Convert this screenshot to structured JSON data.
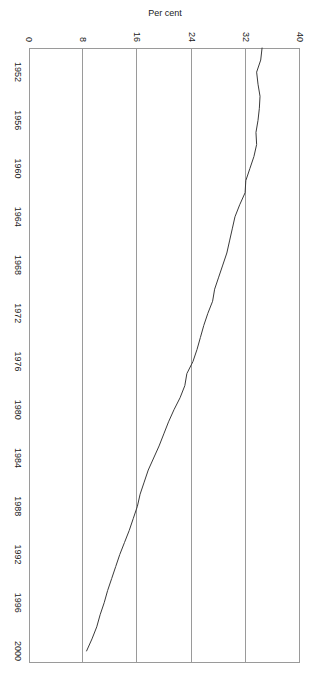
{
  "chart_data": {
    "type": "line",
    "title": "",
    "subtitle": "",
    "xlabel": "",
    "ylabel": "Per cent",
    "xlim": [
      1950,
      2001
    ],
    "ylim": [
      0,
      40
    ],
    "grid": "vertical-only-on-value-axis",
    "legend": "none",
    "orientation": "rotated-90-clockwise",
    "x_tick_labels": [
      "1952",
      "1956",
      "1960",
      "1964",
      "1968",
      "1972",
      "1976",
      "1980",
      "1984",
      "1988",
      "1992",
      "1996",
      "2000"
    ],
    "x_tick_values": [
      1952,
      1956,
      1960,
      1964,
      1968,
      1972,
      1976,
      1980,
      1984,
      1988,
      1992,
      1996,
      2000
    ],
    "y_tick_labels": [
      "0",
      "8",
      "16",
      "24",
      "32",
      "40"
    ],
    "y_tick_values": [
      0,
      8,
      16,
      24,
      32,
      40
    ],
    "line_color": "#3a3a3a",
    "axis_color": "#9a9a9a",
    "series": [
      {
        "name": "Per cent",
        "x": [
          1950,
          1951,
          1952,
          1953,
          1954,
          1955,
          1956,
          1957,
          1958,
          1959,
          1960,
          1961,
          1962,
          1963,
          1964,
          1965,
          1966,
          1967,
          1968,
          1969,
          1970,
          1971,
          1972,
          1973,
          1974,
          1975,
          1976,
          1977,
          1978,
          1979,
          1980,
          1981,
          1982,
          1983,
          1984,
          1985,
          1986,
          1987,
          1988,
          1989,
          1990,
          1991,
          1992,
          1993,
          1994,
          1995,
          1996,
          1997,
          1998,
          1999,
          2000
        ],
        "values": [
          34.4,
          34.2,
          33.6,
          33.8,
          34.1,
          34.0,
          33.8,
          33.5,
          33.6,
          33.2,
          32.6,
          32.0,
          31.9,
          31.1,
          30.4,
          30.0,
          29.6,
          29.2,
          28.6,
          28.0,
          27.4,
          27.1,
          26.4,
          25.8,
          25.3,
          24.8,
          24.2,
          23.3,
          23.0,
          22.3,
          21.4,
          20.6,
          19.9,
          19.2,
          18.4,
          17.6,
          17.0,
          16.4,
          16.0,
          15.4,
          14.8,
          14.1,
          13.4,
          12.8,
          12.2,
          11.6,
          11.1,
          10.5,
          10.0,
          9.3,
          8.5
        ]
      }
    ]
  },
  "axis": {
    "y_title": "Per cent"
  }
}
